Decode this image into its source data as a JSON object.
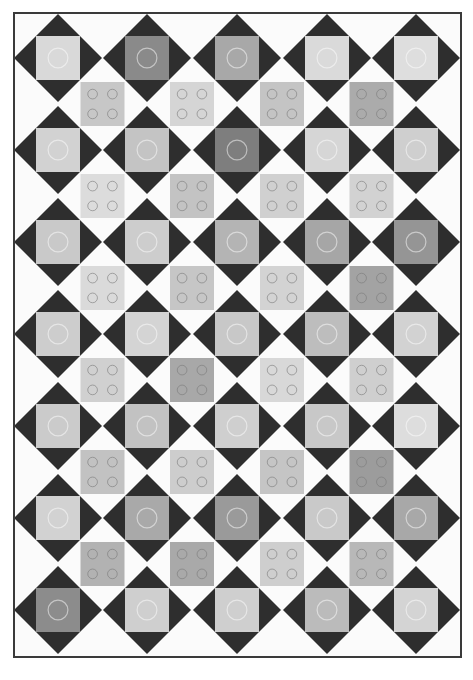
{
  "image": {
    "subject": "black and white photograph of a quilt",
    "width": 473,
    "height": 680,
    "background": "#ffffff"
  },
  "quilt": {
    "bounds": {
      "x": 14,
      "y": 13,
      "w": 447,
      "h": 644
    },
    "border_color": "#3a3a3a",
    "field_color": "#fbfbfb",
    "diamond_color": "#2e2e2e",
    "columns": 5,
    "rows": 7,
    "col_centers": [
      58,
      147,
      237,
      327,
      416
    ],
    "row_centers": [
      58,
      150,
      242,
      334,
      426,
      518,
      610
    ],
    "diamond_half": 44,
    "square_half": 22,
    "main_squares": [
      [
        "#d9d9d9",
        "#8a8a8a",
        "#a8a8a8",
        "#dadada",
        "#dedede"
      ],
      [
        "#d2d2d2",
        "#c4c4c4",
        "#7e7e7e",
        "#d6d6d6",
        "#cfcfcf"
      ],
      [
        "#c9c9c9",
        "#cdcdcd",
        "#b4b4b4",
        "#a6a6a6",
        "#959595"
      ],
      [
        "#cdcdcd",
        "#d4d4d4",
        "#c8c8c8",
        "#bdbdbd",
        "#d2d2d2"
      ],
      [
        "#cbcbcb",
        "#c2c2c2",
        "#cfcfcf",
        "#c8c8c8",
        "#dddddd"
      ],
      [
        "#d2d2d2",
        "#a9a9a9",
        "#9a9a9a",
        "#c9c9c9",
        "#a8a8a8"
      ],
      [
        "#8c8c8c",
        "#cfcfcf",
        "#cfcfcf",
        "#bbbbbb",
        "#d4d4d4"
      ]
    ],
    "offset_squares": [
      [
        "#c7c7c7",
        "#d5d5d5",
        "#c4c4c4",
        "#ababab"
      ],
      [
        "#dcdcdc",
        "#c3c3c3",
        "#d0d0d0",
        "#d2d2d2"
      ],
      [
        "#dadada",
        "#c6c6c6",
        "#d3d3d3",
        "#a3a3a3"
      ],
      [
        "#d0d0d0",
        "#a8a8a8",
        "#d8d8d8",
        "#cfcfcf"
      ],
      [
        "#c2c2c2",
        "#cdcdcd",
        "#c5c5c5",
        "#9c9c9c"
      ],
      [
        "#b2b2b2",
        "#a9a9a9",
        "#cecece",
        "#b8b8b8"
      ]
    ]
  }
}
